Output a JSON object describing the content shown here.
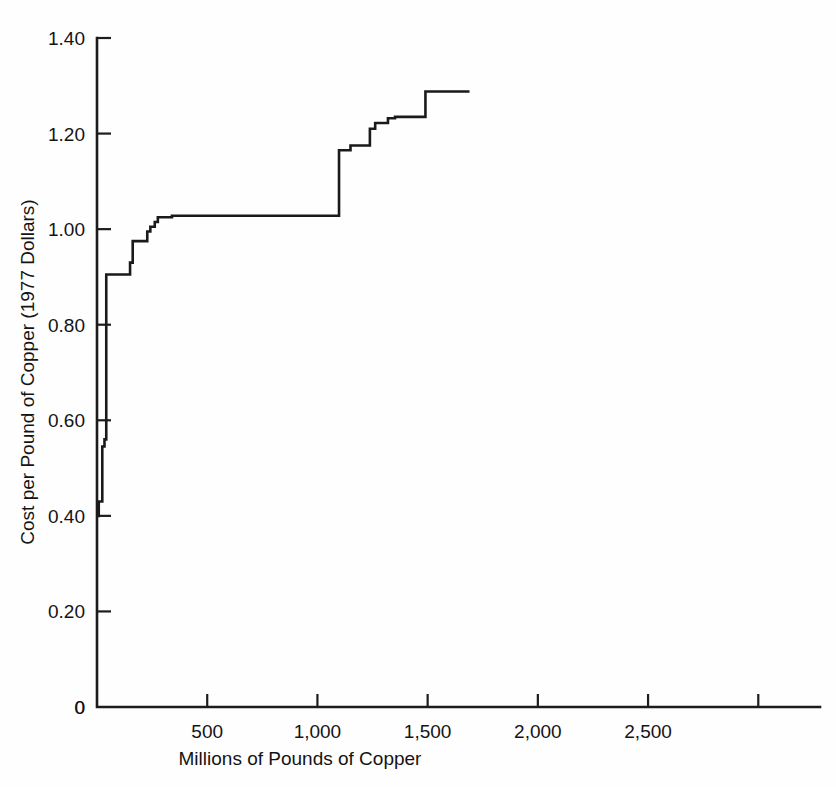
{
  "figure": {
    "background_color": "#fefefe",
    "ink_color": "#1a1a1a",
    "width": 836,
    "height": 787
  },
  "chart_data": {
    "type": "line",
    "subtype": "step",
    "title": "",
    "xlabel": "Millions of Pounds of Copper",
    "ylabel": "Cost per Pound of Copper (1977 Dollars)",
    "xlim": [
      0,
      3280
    ],
    "ylim": [
      0,
      1.4
    ],
    "grid": false,
    "legend": null,
    "xticks": [
      0,
      500,
      1000,
      1500,
      2000,
      2500,
      3000
    ],
    "xtick_labels": [
      "0",
      "500",
      "1,000",
      "1,500",
      "2,000",
      "2,500",
      ""
    ],
    "yticks": [
      0,
      0.2,
      0.4,
      0.6,
      0.8,
      1.0,
      1.2,
      1.4
    ],
    "ytick_labels": [
      "0",
      "0.20",
      "0.40",
      "0.60",
      "0.80",
      "1.00",
      "1.20",
      "1.40"
    ],
    "series": [
      {
        "name": "Copper supply curve",
        "step_mode": "post",
        "x": [
          0,
          8,
          8,
          24,
          24,
          34,
          34,
          42,
          42,
          150,
          150,
          162,
          162,
          228,
          228,
          242,
          242,
          262,
          262,
          276,
          276,
          340,
          340,
          1098,
          1098,
          1150,
          1150,
          1238,
          1238,
          1262,
          1262,
          1320,
          1320,
          1352,
          1352,
          1490,
          1490,
          1690
        ],
        "y": [
          0.4,
          0.4,
          0.43,
          0.43,
          0.545,
          0.545,
          0.56,
          0.56,
          0.905,
          0.905,
          0.93,
          0.93,
          0.975,
          0.975,
          0.995,
          0.995,
          1.005,
          1.005,
          1.015,
          1.015,
          1.025,
          1.025,
          1.028,
          1.028,
          1.165,
          1.165,
          1.175,
          1.175,
          1.21,
          1.21,
          1.222,
          1.222,
          1.232,
          1.232,
          1.235,
          1.235,
          1.288,
          1.288
        ],
        "description": "Cumulative supply step function of copper production cost versus cumulative millions of pounds of copper."
      }
    ]
  }
}
